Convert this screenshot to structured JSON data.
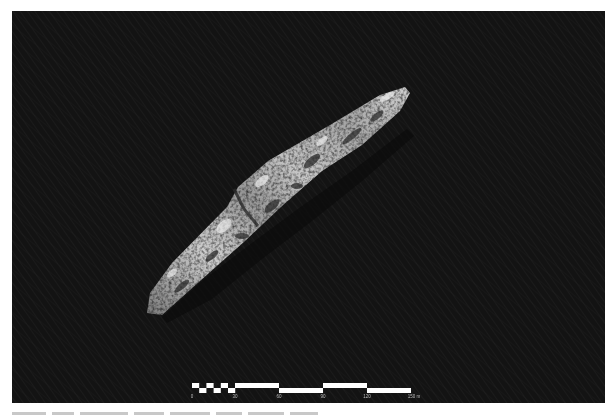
{
  "image": {
    "subject": "sonar-shipwreck-image",
    "background_color": "#131313",
    "wreck_highlight_color": "#d8d8d8"
  },
  "scale_bar": {
    "unit": "m",
    "labels": [
      "0",
      "30",
      "60",
      "90",
      "120",
      "150 m"
    ],
    "tick_values": [
      0,
      30,
      60,
      90,
      120,
      150
    ],
    "bar_color": "#ffffff"
  },
  "caption": {
    "text_visible": false
  }
}
